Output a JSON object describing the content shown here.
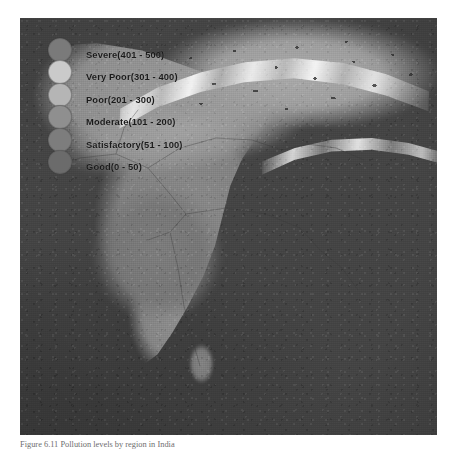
{
  "figure": {
    "caption": "Figure 6.11 Pollution levels by region in India",
    "map_title": "air-quality-index-map-india"
  },
  "legend": {
    "title": "Air Quality Index",
    "items": [
      {
        "label": "Severe(401 - 500)",
        "category": "Severe",
        "range": "401 - 500",
        "min": 401,
        "max": 500,
        "color": "#7a7a7a"
      },
      {
        "label": "Very Poor(301 - 400)",
        "category": "Very Poor",
        "range": "301 - 400",
        "min": 301,
        "max": 400,
        "color": "#c9c9c9"
      },
      {
        "label": "Poor(201 - 300)",
        "category": "Poor",
        "range": "201 - 300",
        "min": 201,
        "max": 300,
        "color": "#b4b4b4"
      },
      {
        "label": "Moderate(101 - 200)",
        "category": "Moderate",
        "range": "101 - 200",
        "min": 101,
        "max": 200,
        "color": "#8f8f8f"
      },
      {
        "label": "Satisfactory(51 - 100)",
        "category": "Satisfactory",
        "range": "51 - 100",
        "min": 51,
        "max": 100,
        "color": "#7d7d7d"
      },
      {
        "label": "Good(0 - 50)",
        "category": "Good",
        "range": "0 - 50",
        "min": 0,
        "max": 50,
        "color": "#6b6b6b"
      }
    ]
  },
  "map": {
    "region": "Indian subcontinent",
    "features": [
      "Arabian Sea",
      "Bay of Bengal",
      "Indian Ocean",
      "Himalaya snow ridge",
      "Tibetan Plateau",
      "Gangetic Plain",
      "Deccan Plateau",
      "Sri Lanka"
    ],
    "style": "grayscale satellite terrain"
  }
}
